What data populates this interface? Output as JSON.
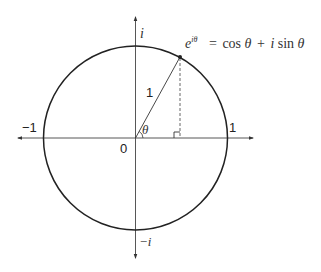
{
  "diagram": {
    "formula": {
      "base": "e",
      "exponent": "iθ",
      "rhs": "= cos θ + i sin θ",
      "parts": {
        "equals": "=",
        "cos": "cos",
        "theta1": "θ",
        "plus": "+",
        "i": "i",
        "sin": "sin",
        "theta2": "θ"
      }
    },
    "labels": {
      "imag_pos": "i",
      "imag_neg": "−i",
      "real_pos": "1",
      "real_neg": "−1",
      "origin": "0",
      "radius": "1",
      "angle": "θ"
    },
    "geometry": {
      "center": [
        135.5,
        138
      ],
      "radius": 92,
      "point": [
        180,
        57
      ],
      "x_axis": [
        17,
        253
      ],
      "y_axis": [
        16,
        258
      ]
    },
    "colors": {
      "stroke": "#222222",
      "dashed": "#555555",
      "text": "#333333"
    }
  }
}
